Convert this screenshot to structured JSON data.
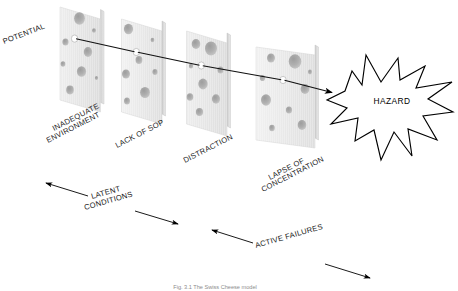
{
  "figure": {
    "background_color": "#ffffff",
    "caption": "Fig. 3.1   The Swiss Cheese model",
    "potential_label": "POTENTIAL",
    "hazard_label": "HAZARD"
  },
  "barriers": [
    {
      "id": "slice-1",
      "label": "INADEQUATE\nENVIRONMENT",
      "label_line1": "INADEQUATE",
      "label_line2": "ENVIRONMENT",
      "order": 1
    },
    {
      "id": "slice-2",
      "label": "LACK OF SOP",
      "label_line1": "LACK OF SOP",
      "label_line2": "",
      "order": 2
    },
    {
      "id": "slice-3",
      "label": "DISTRACTION",
      "label_line1": "DISTRACTION",
      "label_line2": "",
      "order": 3
    },
    {
      "id": "slice-4",
      "label": "LAPSE OF\nCONCENTRATION",
      "label_line1": "LAPSE OF",
      "label_line2": "CONCENTRATION",
      "order": 4
    }
  ],
  "dimensions": [
    {
      "id": "latent",
      "label_line1": "LATENT",
      "label_line2": "CONDITIONS",
      "label": "LATENT CONDITIONS"
    },
    {
      "id": "active",
      "label_line1": "ACTIVE FAILURES",
      "label_line2": "",
      "label": "ACTIVE FAILURES"
    }
  ],
  "colors": {
    "cheese_light": "#f0f0f0",
    "cheese_mid": "#e2e2e2",
    "cheese_edge": "#d2d2d2",
    "hole_dark": "#b3b3b3",
    "line": "#111111",
    "text": "#1a1a1a"
  }
}
